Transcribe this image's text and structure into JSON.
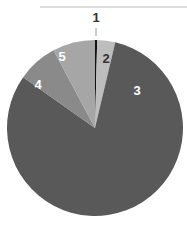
{
  "chart_data": {
    "type": "pie",
    "title": "",
    "categories": [
      "1",
      "2",
      "3",
      "4",
      "5"
    ],
    "values": [
      0.4,
      3.3,
      81.1,
      7.4,
      7.8
    ],
    "colors": [
      "#111111",
      "#bdbdbd",
      "#595959",
      "#8a8a8a",
      "#a6a6a6"
    ],
    "label_colors": [
      "#333333",
      "#333333",
      "#ffffff",
      "#ffffff",
      "#ffffff"
    ],
    "start_angle_deg": 0,
    "direction": "clockwise",
    "legend": "none",
    "data_labels": "category"
  }
}
